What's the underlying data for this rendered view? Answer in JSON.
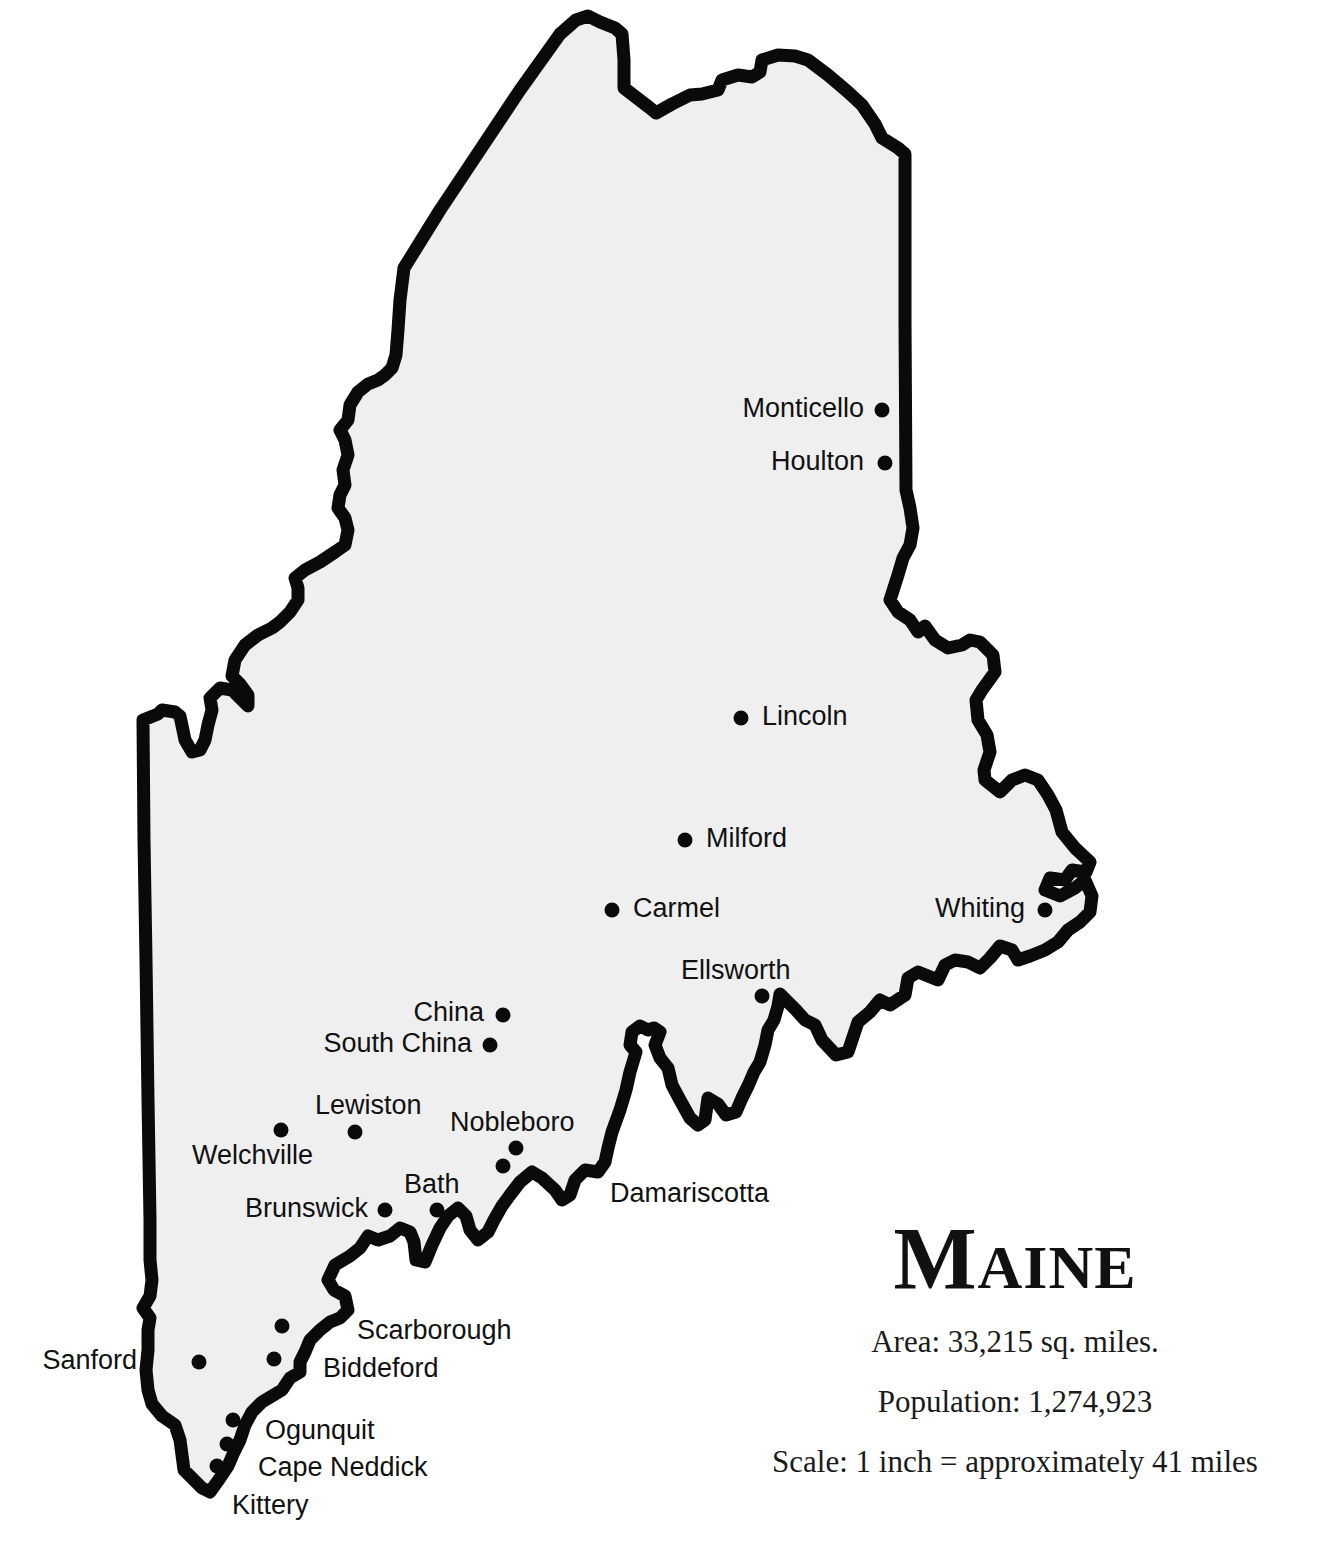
{
  "map": {
    "title": "Maine",
    "colors": {
      "fill": "#efefef",
      "outline": "#0a0a0a",
      "text": "#111111"
    }
  },
  "info": {
    "area": "Area: 33,215 sq. miles.",
    "population": "Population: 1,274,923",
    "scale": "Scale: 1 inch = approximately 41 miles"
  },
  "cities": [
    {
      "name": "Monticello",
      "x": 882,
      "y": 410,
      "label_x": 864,
      "label_y": 408,
      "anchor": "right"
    },
    {
      "name": "Houlton",
      "x": 885,
      "y": 463,
      "label_x": 864,
      "label_y": 461,
      "anchor": "right"
    },
    {
      "name": "Lincoln",
      "x": 741,
      "y": 718,
      "label_x": 762,
      "label_y": 716,
      "anchor": "left"
    },
    {
      "name": "Milford",
      "x": 685,
      "y": 840,
      "label_x": 706,
      "label_y": 838,
      "anchor": "left"
    },
    {
      "name": "Carmel",
      "x": 612,
      "y": 910,
      "label_x": 633,
      "label_y": 908,
      "anchor": "left"
    },
    {
      "name": "Whiting",
      "x": 1045,
      "y": 910,
      "label_x": 1025,
      "label_y": 908,
      "anchor": "right"
    },
    {
      "name": "Ellsworth",
      "x": 762,
      "y": 996,
      "label_x": 681,
      "label_y": 970,
      "anchor": "left"
    },
    {
      "name": "China",
      "x": 503,
      "y": 1015,
      "label_x": 484,
      "label_y": 1012,
      "anchor": "right"
    },
    {
      "name": "South China",
      "x": 490,
      "y": 1045,
      "label_x": 472,
      "label_y": 1043,
      "anchor": "right"
    },
    {
      "name": "Lewiston",
      "x": 355,
      "y": 1132,
      "label_x": 315,
      "label_y": 1105,
      "anchor": "left"
    },
    {
      "name": "Welchville",
      "x": 281,
      "y": 1130,
      "label_x": 192,
      "label_y": 1155,
      "anchor": "left"
    },
    {
      "name": "Nobleboro",
      "x": 516,
      "y": 1148,
      "label_x": 450,
      "label_y": 1122,
      "anchor": "left"
    },
    {
      "name": "Damariscotta",
      "x": 503,
      "y": 1166,
      "label_x": 610,
      "label_y": 1193,
      "anchor": "left"
    },
    {
      "name": "Bath",
      "x": 437,
      "y": 1210,
      "label_x": 404,
      "label_y": 1184,
      "anchor": "left"
    },
    {
      "name": "Brunswick",
      "x": 385,
      "y": 1210,
      "label_x": 368,
      "label_y": 1208,
      "anchor": "right"
    },
    {
      "name": "Scarborough",
      "x": 282,
      "y": 1326,
      "label_x": 357,
      "label_y": 1330,
      "anchor": "left"
    },
    {
      "name": "Biddeford",
      "x": 274,
      "y": 1359,
      "label_x": 323,
      "label_y": 1368,
      "anchor": "left"
    },
    {
      "name": "Sanford",
      "x": 199,
      "y": 1362,
      "label_x": 137,
      "label_y": 1360,
      "anchor": "right"
    },
    {
      "name": "Ogunquit",
      "x": 233,
      "y": 1420,
      "label_x": 265,
      "label_y": 1430,
      "anchor": "left"
    },
    {
      "name": "Cape Neddick",
      "x": 227,
      "y": 1444,
      "label_x": 258,
      "label_y": 1467,
      "anchor": "left"
    },
    {
      "name": "Kittery",
      "x": 217,
      "y": 1466,
      "label_x": 232,
      "label_y": 1505,
      "anchor": "left"
    }
  ]
}
